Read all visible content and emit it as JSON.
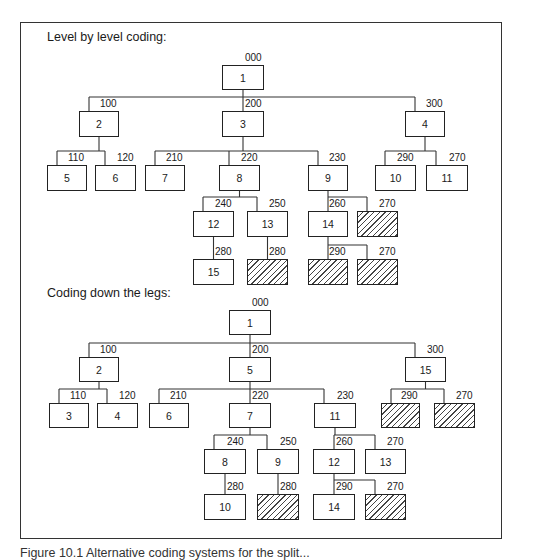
{
  "figure": {
    "caption": "Figure 10.1  Alternative coding systems for the split..."
  },
  "top": {
    "title": "Level by level coding:",
    "nodes": [
      {
        "id": "t1",
        "label": "1",
        "code": "000",
        "x": 222,
        "y": 65,
        "w": 42,
        "h": 25,
        "hatched": false
      },
      {
        "id": "t2",
        "label": "2",
        "code": "100",
        "x": 79,
        "y": 111,
        "w": 40,
        "h": 26,
        "hatched": false
      },
      {
        "id": "t3",
        "label": "3",
        "code": "200",
        "x": 222,
        "y": 111,
        "w": 42,
        "h": 26,
        "hatched": false
      },
      {
        "id": "t4",
        "label": "4",
        "code": "300",
        "x": 405,
        "y": 111,
        "w": 40,
        "h": 26,
        "hatched": false
      },
      {
        "id": "t5",
        "label": "5",
        "code": "110",
        "x": 47,
        "y": 165,
        "w": 40,
        "h": 26,
        "hatched": false
      },
      {
        "id": "t6",
        "label": "6",
        "code": "120",
        "x": 95,
        "y": 165,
        "w": 41,
        "h": 26,
        "hatched": false
      },
      {
        "id": "t7",
        "label": "7",
        "code": "210",
        "x": 145,
        "y": 165,
        "w": 40,
        "h": 26,
        "hatched": false
      },
      {
        "id": "t8",
        "label": "8",
        "code": "220",
        "x": 219,
        "y": 165,
        "w": 41,
        "h": 26,
        "hatched": false
      },
      {
        "id": "t9",
        "label": "9",
        "code": "230",
        "x": 308,
        "y": 165,
        "w": 40,
        "h": 26,
        "hatched": false
      },
      {
        "id": "t10",
        "label": "10",
        "code": "290",
        "x": 375,
        "y": 165,
        "w": 41,
        "h": 26,
        "hatched": false
      },
      {
        "id": "t11",
        "label": "11",
        "code": "270",
        "x": 426,
        "y": 165,
        "w": 42,
        "h": 26,
        "hatched": false
      },
      {
        "id": "t12",
        "label": "12",
        "code": "240",
        "x": 193,
        "y": 211,
        "w": 41,
        "h": 26,
        "hatched": false
      },
      {
        "id": "t13",
        "label": "13",
        "code": "250",
        "x": 247,
        "y": 211,
        "w": 41,
        "h": 26,
        "hatched": false
      },
      {
        "id": "t14",
        "label": "14",
        "code": "260",
        "x": 308,
        "y": 211,
        "w": 40,
        "h": 26,
        "hatched": false
      },
      {
        "id": "th1",
        "label": "",
        "code": "270",
        "x": 357,
        "y": 211,
        "w": 41,
        "h": 26,
        "hatched": true
      },
      {
        "id": "t15",
        "label": "15",
        "code": "280",
        "x": 193,
        "y": 259,
        "w": 41,
        "h": 26,
        "hatched": false
      },
      {
        "id": "th2",
        "label": "",
        "code": "280",
        "x": 247,
        "y": 259,
        "w": 41,
        "h": 26,
        "hatched": true
      },
      {
        "id": "th3",
        "label": "",
        "code": "290",
        "x": 308,
        "y": 259,
        "w": 40,
        "h": 26,
        "hatched": true
      },
      {
        "id": "th4",
        "label": "",
        "code": "270",
        "x": 357,
        "y": 259,
        "w": 41,
        "h": 26,
        "hatched": true
      }
    ],
    "edges": [
      [
        "t1",
        [
          "t2",
          "t3",
          "t4"
        ]
      ],
      [
        "t2",
        [
          "t5",
          "t6"
        ]
      ],
      [
        "t3",
        [
          "t7",
          "t8",
          "t9"
        ]
      ],
      [
        "t4",
        [
          "t10",
          "t11"
        ]
      ],
      [
        "t8",
        [
          "t12",
          "t13"
        ]
      ],
      [
        "t9",
        [
          "t14",
          "th1"
        ]
      ],
      [
        "t12",
        [
          "t15"
        ]
      ],
      [
        "t13",
        [
          "th2"
        ]
      ],
      [
        "t14",
        [
          "th3",
          "th4"
        ]
      ]
    ]
  },
  "bottom": {
    "title": "Coding down the legs:",
    "nodes": [
      {
        "id": "b1",
        "label": "1",
        "code": "000",
        "x": 229,
        "y": 310,
        "w": 42,
        "h": 25,
        "hatched": false
      },
      {
        "id": "b2",
        "label": "2",
        "code": "100",
        "x": 79,
        "y": 357,
        "w": 40,
        "h": 25,
        "hatched": false
      },
      {
        "id": "b5",
        "label": "5",
        "code": "200",
        "x": 229,
        "y": 357,
        "w": 42,
        "h": 25,
        "hatched": false
      },
      {
        "id": "b15",
        "label": "15",
        "code": "300",
        "x": 405,
        "y": 357,
        "w": 41,
        "h": 25,
        "hatched": false
      },
      {
        "id": "b3",
        "label": "3",
        "code": "110",
        "x": 49,
        "y": 403,
        "w": 40,
        "h": 25,
        "hatched": false
      },
      {
        "id": "b4",
        "label": "4",
        "code": "120",
        "x": 97,
        "y": 403,
        "w": 41,
        "h": 25,
        "hatched": false
      },
      {
        "id": "b6",
        "label": "6",
        "code": "210",
        "x": 149,
        "y": 403,
        "w": 40,
        "h": 25,
        "hatched": false
      },
      {
        "id": "b7",
        "label": "7",
        "code": "220",
        "x": 229,
        "y": 403,
        "w": 42,
        "h": 25,
        "hatched": false
      },
      {
        "id": "b11",
        "label": "11",
        "code": "230",
        "x": 314,
        "y": 403,
        "w": 42,
        "h": 25,
        "hatched": false
      },
      {
        "id": "bh1",
        "label": "",
        "code": "290",
        "x": 381,
        "y": 403,
        "w": 39,
        "h": 25,
        "hatched": true
      },
      {
        "id": "bh2",
        "label": "",
        "code": "270",
        "x": 434,
        "y": 403,
        "w": 41,
        "h": 25,
        "hatched": true
      },
      {
        "id": "b8",
        "label": "8",
        "code": "240",
        "x": 204,
        "y": 449,
        "w": 42,
        "h": 25,
        "hatched": false
      },
      {
        "id": "b9",
        "label": "9",
        "code": "250",
        "x": 257,
        "y": 449,
        "w": 42,
        "h": 25,
        "hatched": false
      },
      {
        "id": "b12",
        "label": "12",
        "code": "260",
        "x": 313,
        "y": 449,
        "w": 42,
        "h": 25,
        "hatched": false
      },
      {
        "id": "b13",
        "label": "13",
        "code": "270",
        "x": 365,
        "y": 449,
        "w": 41,
        "h": 25,
        "hatched": false
      },
      {
        "id": "b10",
        "label": "10",
        "code": "280",
        "x": 204,
        "y": 494,
        "w": 42,
        "h": 26,
        "hatched": false
      },
      {
        "id": "bh3",
        "label": "",
        "code": "280",
        "x": 257,
        "y": 494,
        "w": 42,
        "h": 26,
        "hatched": true
      },
      {
        "id": "b14",
        "label": "14",
        "code": "290",
        "x": 313,
        "y": 494,
        "w": 42,
        "h": 26,
        "hatched": false
      },
      {
        "id": "bh4",
        "label": "",
        "code": "270",
        "x": 365,
        "y": 494,
        "w": 41,
        "h": 26,
        "hatched": true
      }
    ],
    "edges": [
      [
        "b1",
        [
          "b2",
          "b5",
          "b15"
        ]
      ],
      [
        "b2",
        [
          "b3",
          "b4"
        ]
      ],
      [
        "b5",
        [
          "b6",
          "b7",
          "b11"
        ]
      ],
      [
        "b15",
        [
          "bh1",
          "bh2"
        ]
      ],
      [
        "b7",
        [
          "b8",
          "b9"
        ]
      ],
      [
        "b11",
        [
          "b12",
          "b13"
        ]
      ],
      [
        "b8",
        [
          "b10"
        ]
      ],
      [
        "b9",
        [
          "bh3"
        ]
      ],
      [
        "b12",
        [
          "b14",
          "bh4"
        ]
      ]
    ]
  }
}
